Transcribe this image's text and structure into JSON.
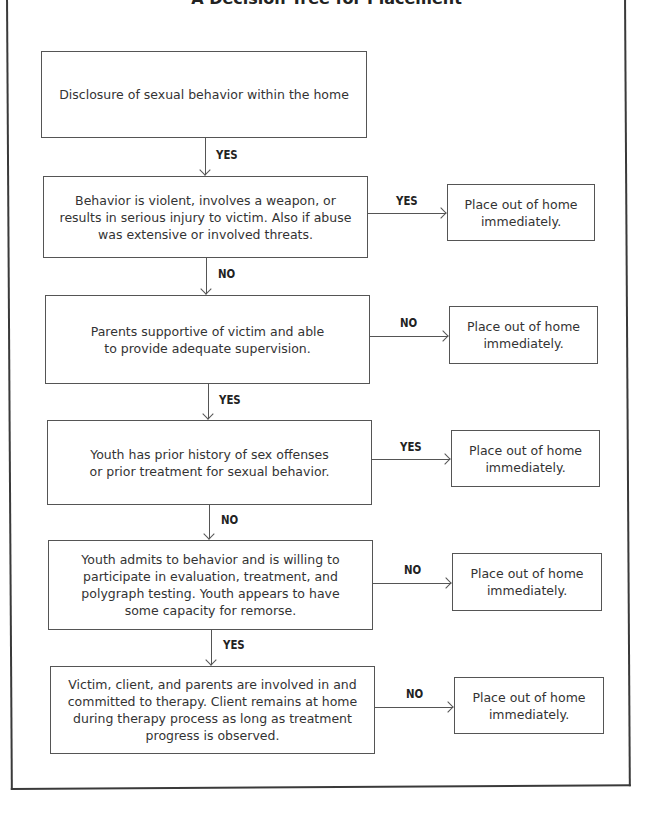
{
  "title": "A Decision Tree for Placement",
  "nodes": [
    {
      "id": "disclosure",
      "text": "Disclosure of sexual behavior within the home"
    },
    {
      "id": "violent",
      "text": "Behavior is violent, involves a weapon, or results in serious injury to victim. Also if abuse was extensive or involved threats."
    },
    {
      "id": "parents",
      "text": "Parents supportive of victim and able to provide adequate supervision."
    },
    {
      "id": "history",
      "text": "Youth has prior history of sex offenses or prior treatment for sexual behavior."
    },
    {
      "id": "admits",
      "text": "Youth admits to behavior and is willing to participate in evaluation, treatment, and polygraph testing. Youth appears to have some capacity for remorse."
    },
    {
      "id": "therapy",
      "text": "Victim, client, and parents are involved in and committed to therapy. Client remains at home during therapy process as long as treatment progress is observed."
    }
  ],
  "outcomes": [
    {
      "from": "violent",
      "label": "YES",
      "text": "Place out of home immediately."
    },
    {
      "from": "parents",
      "label": "NO",
      "text": "Place out of home immediately."
    },
    {
      "from": "history",
      "label": "YES",
      "text": "Place out of home immediately."
    },
    {
      "from": "admits",
      "label": "NO",
      "text": "Place out of home immediately."
    },
    {
      "from": "therapy",
      "label": "NO",
      "text": "Place out of home immediately."
    }
  ],
  "down_edges": [
    {
      "from": "disclosure",
      "to": "violent",
      "label": "YES"
    },
    {
      "from": "violent",
      "to": "parents",
      "label": "NO"
    },
    {
      "from": "parents",
      "to": "history",
      "label": "YES"
    },
    {
      "from": "history",
      "to": "admits",
      "label": "NO"
    },
    {
      "from": "admits",
      "to": "therapy",
      "label": "YES"
    }
  ]
}
